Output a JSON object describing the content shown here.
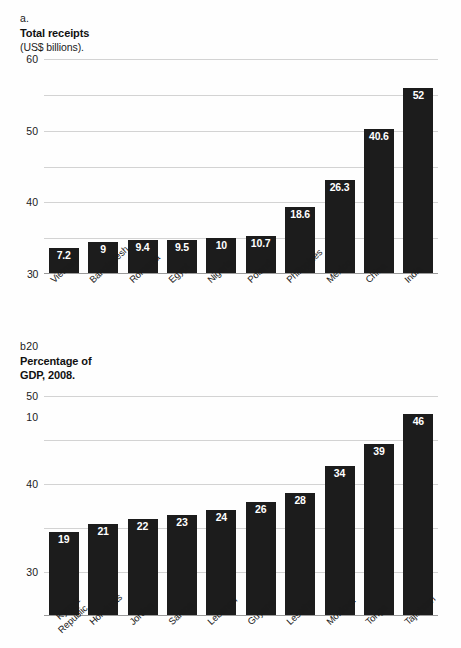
{
  "chart_data": [
    {
      "type": "bar",
      "panel": "a.",
      "title": "Total receipts",
      "subtitle": "(US$ billions).",
      "xlabel": "",
      "ylabel": "",
      "ylim": [
        0,
        60
      ],
      "yticks": [
        60,
        50,
        40,
        30,
        20,
        10
      ],
      "ytick_labels": [
        "60",
        "50",
        "40",
        "30",
        "20",
        "10"
      ],
      "grid": true,
      "legend": "none",
      "categories": [
        "Vietnam",
        "Bangladesh",
        "Romania",
        "Egypt",
        "Nigeria",
        "Poland",
        "Philippines",
        "Mexico",
        "China",
        "India"
      ],
      "values": [
        7.2,
        9,
        9.4,
        9.5,
        10,
        10.7,
        18.6,
        26.3,
        40.6,
        52
      ],
      "value_labels": [
        "7.2",
        "9",
        "9.4",
        "9.5",
        "10",
        "10.7",
        "18.6",
        "26.3",
        "40.6",
        "52"
      ],
      "bar_color": "#1c1c1c",
      "label_color": "#ffffff"
    },
    {
      "type": "bar",
      "panel": "b.",
      "title": "Percentage of\nGDP, 2008.",
      "subtitle": "",
      "xlabel": "",
      "ylabel": "",
      "ylim": [
        0,
        50
      ],
      "yticks": [
        50,
        40,
        30,
        20,
        10
      ],
      "ytick_labels": [
        "50",
        "40",
        "30",
        "20",
        "10"
      ],
      "grid": true,
      "legend": "none",
      "categories": [
        "Kyrgyz\nRepublic",
        "Honduras",
        "Jordan",
        "Samoa",
        "Lebanon",
        "Guyana",
        "Lesotho",
        "Moldova",
        "Tonga",
        "Tajikistan"
      ],
      "values": [
        19,
        21,
        22,
        23,
        24,
        26,
        28,
        34,
        39,
        46
      ],
      "value_labels": [
        "19",
        "21",
        "22",
        "23",
        "24",
        "26",
        "28",
        "34",
        "39",
        "46"
      ],
      "bar_color": "#1c1c1c",
      "label_color": "#ffffff"
    }
  ]
}
